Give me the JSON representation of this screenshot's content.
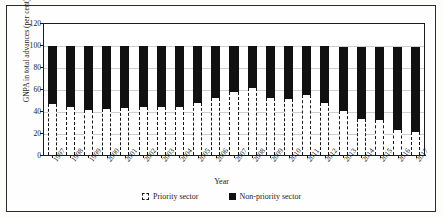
{
  "figure": {
    "ylabel": "GNPA in total advances (per cent)",
    "xlabel": "Year"
  },
  "legend": {
    "items": [
      {
        "label": "Priority sector",
        "swatch": "white-dashed-square",
        "color": "#ffffff"
      },
      {
        "label": "Non-priority sector",
        "swatch": "black-square",
        "color": "#111111"
      }
    ]
  },
  "chart_data": {
    "type": "bar",
    "stacked": true,
    "title": "",
    "xlabel": "Year",
    "ylabel": "GNPA in total advances (per cent)",
    "ylim": [
      0,
      120
    ],
    "yticks": [
      0,
      20,
      40,
      60,
      80,
      100,
      120
    ],
    "grid": true,
    "legend_position": "bottom",
    "categories": [
      "1997",
      "1998",
      "1999",
      "2000",
      "2001",
      "2002",
      "2003",
      "2004",
      "2005",
      "2006",
      "2007",
      "2008",
      "2009",
      "2010",
      "2011",
      "2012",
      "2013",
      "2014",
      "2015",
      "2016",
      "2017"
    ],
    "series": [
      {
        "name": "Priority sector",
        "color": "#ffffff",
        "values": [
          46,
          44,
          41,
          42,
          43,
          44,
          44,
          44,
          47,
          52,
          57,
          61,
          52,
          51,
          55,
          47,
          40,
          33,
          32,
          23,
          21
        ]
      },
      {
        "name": "Non-priority sector",
        "color": "#111111",
        "values": [
          53,
          55,
          58,
          57,
          56,
          55,
          55,
          55,
          52,
          47,
          42,
          38,
          47,
          48,
          44,
          52,
          58,
          65,
          66,
          75,
          77
        ]
      }
    ],
    "totals": [
      99,
      99,
      99,
      99,
      99,
      99,
      99,
      99,
      99,
      99,
      99,
      99,
      99,
      99,
      99,
      99,
      98,
      98,
      98,
      98,
      98
    ]
  }
}
